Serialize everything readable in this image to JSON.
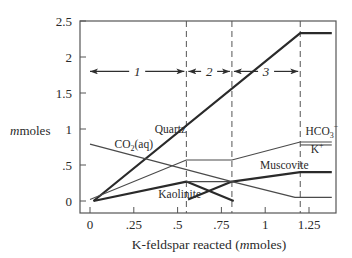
{
  "chart_data": {
    "type": "line",
    "title": "",
    "xlabel": "K-feldspar reacted (mmoles)",
    "xlabel_parts": {
      "pre": "K-feldspar reacted (",
      "italic": "m",
      "post": "moles)"
    },
    "ylabel": "mmoles",
    "ylabel_parts": {
      "italic": "m",
      "post": "moles"
    },
    "xlim": [
      -0.06,
      1.41
    ],
    "ylim": [
      -0.17,
      2.5
    ],
    "x_ticks": [
      0,
      0.25,
      0.5,
      0.75,
      1,
      1.25
    ],
    "x_tick_labels": [
      "0",
      ".25",
      ".5",
      ".75",
      "1",
      "1.25"
    ],
    "y_ticks": [
      0,
      0.5,
      1,
      1.5,
      2,
      2.5
    ],
    "y_tick_labels": [
      "0",
      ".5",
      "1",
      "1.5",
      "2",
      "2.5"
    ],
    "grid": false,
    "legend": "none (inline labels)",
    "boundaries": [
      0.55,
      0.81,
      1.2
    ],
    "regions": [
      {
        "label": "1",
        "x_start": 0.0,
        "x_end": 0.55,
        "y": 1.8
      },
      {
        "label": "2",
        "x_start": 0.55,
        "x_end": 0.81,
        "y": 1.8
      },
      {
        "label": "3",
        "x_start": 0.81,
        "x_end": 1.2,
        "y": 1.8
      }
    ],
    "series": [
      {
        "name": "Quartz",
        "weight": "thick",
        "x": [
          0.02,
          1.2,
          1.38
        ],
        "y": [
          0.0,
          2.33,
          2.33
        ]
      },
      {
        "name": "HCO3- / K+",
        "weight": "thin",
        "x": [
          0.0,
          0.55,
          0.81,
          1.2,
          1.38
        ],
        "y": [
          0.02,
          0.57,
          0.57,
          0.82,
          0.82
        ]
      },
      {
        "name": "Kaolinite",
        "weight": "thick",
        "x": [
          0.02,
          0.55,
          0.82
        ],
        "y": [
          0.0,
          0.27,
          0.0
        ]
      },
      {
        "name": "Muscovite",
        "weight": "thick",
        "x": [
          0.56,
          0.81,
          1.2,
          1.38
        ],
        "y": [
          0.02,
          0.27,
          0.4,
          0.4
        ]
      },
      {
        "name": "CO2(aq)",
        "weight": "thin",
        "x": [
          0.0,
          0.81,
          1.17,
          1.38
        ],
        "y": [
          0.79,
          0.27,
          0.05,
          0.05
        ]
      },
      {
        "name": "reference",
        "weight": "thin",
        "x": [
          0.55,
          0.81
        ],
        "y": [
          0.27,
          0.27
        ]
      }
    ],
    "annotations": [
      {
        "text": "Quartz",
        "x": 0.37,
        "y": 0.95
      },
      {
        "text": "CO2(aq)",
        "x": 0.14,
        "y": 0.73
      },
      {
        "text": "Kaolinite",
        "x": 0.39,
        "y": 0.04
      },
      {
        "text": "Muscovite",
        "x": 0.97,
        "y": 0.45
      },
      {
        "text": "HCO3-",
        "x": 1.23,
        "y": 0.92
      },
      {
        "text": "K+",
        "x": 1.26,
        "y": 0.66
      }
    ]
  }
}
